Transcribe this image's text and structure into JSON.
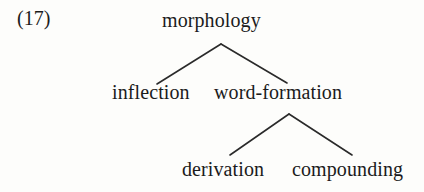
{
  "figure": {
    "example_number": "(17)",
    "background_color": "#fdfdfb",
    "stroke_color": "#2a2a2a",
    "text_color": "#1b1b1b"
  },
  "tree": {
    "root": {
      "label": "morphology",
      "children": [
        {
          "label": "inflection",
          "children": []
        },
        {
          "label": "word-formation",
          "children": [
            {
              "label": "derivation",
              "children": []
            },
            {
              "label": "compounding",
              "children": []
            }
          ]
        }
      ]
    }
  },
  "nodes": {
    "root": "morphology",
    "level2_left": "inflection",
    "level2_right": "word-formation",
    "level3_left": "derivation",
    "level3_right": "compounding"
  },
  "branches": [
    {
      "name": "root-to-inflection",
      "from": [
        221,
        44
      ],
      "to": [
        157,
        84
      ]
    },
    {
      "name": "root-to-word-formation",
      "from": [
        221,
        44
      ],
      "to": [
        287,
        83
      ]
    },
    {
      "name": "word-formation-to-derivation",
      "from": [
        289,
        114
      ],
      "to": [
        230,
        155
      ]
    },
    {
      "name": "word-formation-to-compounding",
      "from": [
        289,
        114
      ],
      "to": [
        352,
        155
      ]
    }
  ]
}
